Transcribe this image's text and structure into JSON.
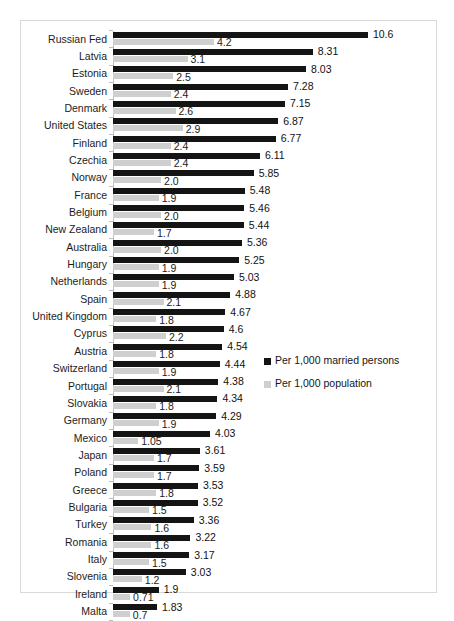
{
  "chart_data": {
    "type": "bar",
    "orientation": "horizontal",
    "title": "",
    "subtitle": "",
    "xlabel": "",
    "ylabel": "",
    "grid": false,
    "xlim": [
      0,
      10.6
    ],
    "legend_position": "middle-right",
    "categories": [
      "Russian Fed",
      "Latvia",
      "Estonia",
      "Sweden",
      "Denmark",
      "United States",
      "Finland",
      "Czechia",
      "Norway",
      "France",
      "Belgium",
      "New Zealand",
      "Australia",
      "Hungary",
      "Netherlands",
      "Spain",
      "United Kingdom",
      "Cyprus",
      "Austria",
      "Switzerland",
      "Portugal",
      "Slovakia",
      "Germany",
      "Mexico",
      "Japan",
      "Poland",
      "Greece",
      "Bulgaria",
      "Turkey",
      "Romania",
      "Italy",
      "Slovenia",
      "Ireland",
      "Malta"
    ],
    "series": [
      {
        "name": "Per 1,000 married persons",
        "color": "#141414",
        "values": [
          10.6,
          8.31,
          8.03,
          7.28,
          7.15,
          6.87,
          6.77,
          6.11,
          5.85,
          5.48,
          5.46,
          5.44,
          5.36,
          5.25,
          5.03,
          4.88,
          4.67,
          4.6,
          4.54,
          4.44,
          4.38,
          4.34,
          4.29,
          4.03,
          3.61,
          3.59,
          3.53,
          3.52,
          3.36,
          3.22,
          3.17,
          3.03,
          1.9,
          1.83
        ],
        "labels": [
          "10.6",
          "8.31",
          "8.03",
          "7.28",
          "7.15",
          "6.87",
          "6.77",
          "6.11",
          "5.85",
          "5.48",
          "5.46",
          "5.44",
          "5.36",
          "5.25",
          "5.03",
          "4.88",
          "4.67",
          "4.6",
          "4.54",
          "4.44",
          "4.38",
          "4.34",
          "4.29",
          "4.03",
          "3.61",
          "3.59",
          "3.53",
          "3.52",
          "3.36",
          "3.22",
          "3.17",
          "3.03",
          "1.9",
          "1.83"
        ]
      },
      {
        "name": "Per 1,000 population",
        "color": "#cfcfcf",
        "values": [
          4.2,
          3.1,
          2.5,
          2.4,
          2.6,
          2.9,
          2.4,
          2.4,
          2.0,
          1.9,
          2.0,
          1.7,
          2.0,
          1.9,
          1.9,
          2.1,
          1.8,
          2.2,
          1.8,
          1.9,
          2.1,
          1.8,
          1.9,
          1.05,
          1.7,
          1.7,
          1.8,
          1.5,
          1.6,
          1.6,
          1.5,
          1.2,
          0.71,
          0.7
        ],
        "labels": [
          "4.2",
          "3.1",
          "2.5",
          "2.4",
          "2.6",
          "2.9",
          "2.4",
          "2.4",
          "2.0",
          "1.9",
          "2.0",
          "1.7",
          "2.0",
          "1.9",
          "1.9",
          "2.1",
          "1.8",
          "2.2",
          "1.8",
          "1.9",
          "2.1",
          "1.8",
          "1.9",
          "1.05",
          "1.7",
          "1.7",
          "1.8",
          "1.5",
          "1.6",
          "1.6",
          "1.5",
          "1.2",
          "0.71",
          "0.7"
        ]
      }
    ]
  },
  "legend": {
    "entries": [
      {
        "label": "Per 1,000 married persons",
        "color": "#141414"
      },
      {
        "label": "Per 1,000 population",
        "color": "#cfcfcf"
      }
    ]
  }
}
